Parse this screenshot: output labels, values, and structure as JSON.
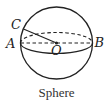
{
  "figure": {
    "caption": "Sphere",
    "points": {
      "A": "A",
      "B": "B",
      "C": "C",
      "O": "O"
    },
    "colors": {
      "stroke": "#222222",
      "background": "#ffffff"
    }
  }
}
